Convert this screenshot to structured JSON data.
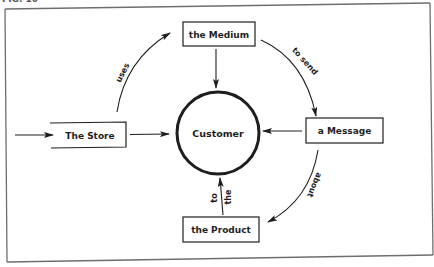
{
  "figure": {
    "caption_fragment": "FIG. 10",
    "colors": {
      "ink": "#1e1e1e",
      "frame": "#6e6e6e",
      "background": "#ffffff"
    }
  },
  "diagram": {
    "center_node": {
      "id": "customer",
      "label": "Customer",
      "shape": "circle"
    },
    "nodes": [
      {
        "id": "store",
        "label": "The Store",
        "shape": "open-left-box"
      },
      {
        "id": "medium",
        "label": "the Medium",
        "shape": "box"
      },
      {
        "id": "message",
        "label": "a Message",
        "shape": "box"
      },
      {
        "id": "product",
        "label": "the Product",
        "shape": "box"
      }
    ],
    "edges": [
      {
        "from": "external",
        "to": "store",
        "label": ""
      },
      {
        "from": "store",
        "to": "customer",
        "label": ""
      },
      {
        "from": "store",
        "to": "medium",
        "label": "uses"
      },
      {
        "from": "medium",
        "to": "customer",
        "label": ""
      },
      {
        "from": "medium",
        "to": "message",
        "label": "to send"
      },
      {
        "from": "message",
        "to": "customer",
        "label": ""
      },
      {
        "from": "message",
        "to": "product",
        "label": "about"
      },
      {
        "from": "product",
        "to": "customer",
        "label_left": "to",
        "label_right": "the"
      }
    ]
  }
}
